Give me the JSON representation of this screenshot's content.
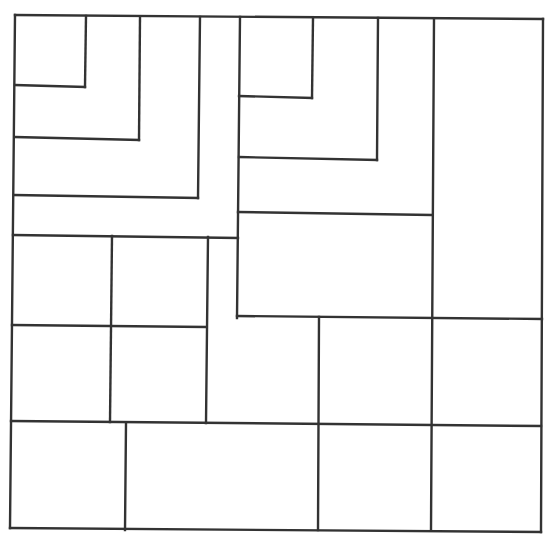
{
  "diagram": {
    "title": "",
    "stroke_color": "#333333",
    "background": "#ffffff",
    "segments": [
      {
        "id": "outer-top",
        "x1": 15,
        "y1": 15,
        "x2": 543,
        "y2": 19
      },
      {
        "id": "outer-right",
        "x1": 543,
        "y1": 19,
        "x2": 541,
        "y2": 532
      },
      {
        "id": "outer-bottom",
        "x1": 10,
        "y1": 528,
        "x2": 541,
        "y2": 532
      },
      {
        "id": "outer-left",
        "x1": 15,
        "y1": 15,
        "x2": 10,
        "y2": 528
      },
      {
        "id": "tl-sq1-v",
        "x1": 86,
        "y1": 16,
        "x2": 85,
        "y2": 87
      },
      {
        "id": "tl-sq1-h",
        "x1": 15,
        "y1": 85,
        "x2": 85,
        "y2": 87
      },
      {
        "id": "tl-sq2-v",
        "x1": 140,
        "y1": 17,
        "x2": 139,
        "y2": 140
      },
      {
        "id": "tl-sq2-h",
        "x1": 15,
        "y1": 137,
        "x2": 139,
        "y2": 140
      },
      {
        "id": "tl-sq3-v",
        "x1": 200,
        "y1": 17,
        "x2": 198,
        "y2": 198
      },
      {
        "id": "tl-sq3-h",
        "x1": 14,
        "y1": 195,
        "x2": 198,
        "y2": 198
      },
      {
        "id": "tl-sq4-v",
        "x1": 240,
        "y1": 17,
        "x2": 237,
        "y2": 318
      },
      {
        "id": "tl-sq4-h",
        "x1": 13,
        "y1": 235,
        "x2": 238,
        "y2": 238
      },
      {
        "id": "tr-sq1-v",
        "x1": 313,
        "y1": 18,
        "x2": 312,
        "y2": 98
      },
      {
        "id": "tr-sq1-h",
        "x1": 239,
        "y1": 96,
        "x2": 312,
        "y2": 98
      },
      {
        "id": "tr-sq2-v",
        "x1": 378,
        "y1": 18,
        "x2": 377,
        "y2": 160
      },
      {
        "id": "tr-sq2-h",
        "x1": 239,
        "y1": 157,
        "x2": 377,
        "y2": 160
      },
      {
        "id": "tr-sq3-v",
        "x1": 434,
        "y1": 19,
        "x2": 431,
        "y2": 530
      },
      {
        "id": "tr-sq3-h",
        "x1": 238,
        "y1": 212,
        "x2": 431,
        "y2": 215
      },
      {
        "id": "mid-h-right",
        "x1": 237,
        "y1": 316,
        "x2": 542,
        "y2": 319
      },
      {
        "id": "mid-v-1",
        "x1": 112,
        "y1": 236,
        "x2": 110,
        "y2": 422
      },
      {
        "id": "mid-v-2",
        "x1": 208,
        "y1": 237,
        "x2": 206,
        "y2": 423
      },
      {
        "id": "mid-h-left",
        "x1": 12,
        "y1": 325,
        "x2": 206,
        "y2": 327
      },
      {
        "id": "mid-v-3",
        "x1": 319,
        "y1": 317,
        "x2": 318,
        "y2": 530
      },
      {
        "id": "bottom-h",
        "x1": 11,
        "y1": 421,
        "x2": 541,
        "y2": 426
      },
      {
        "id": "bottom-v-1",
        "x1": 126,
        "y1": 423,
        "x2": 125,
        "y2": 530
      }
    ]
  }
}
